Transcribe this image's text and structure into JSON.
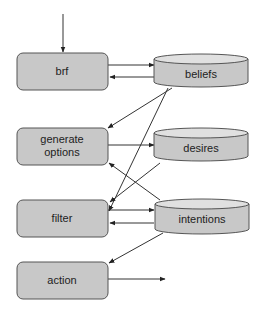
{
  "diagram": {
    "type": "BDI agent architecture flow",
    "processes": [
      {
        "id": "brf",
        "label": "brf"
      },
      {
        "id": "generate_options",
        "label_line1": "generate",
        "label_line2": "options"
      },
      {
        "id": "filter",
        "label": "filter"
      },
      {
        "id": "action",
        "label": "action"
      }
    ],
    "stores": [
      {
        "id": "beliefs",
        "label": "beliefs"
      },
      {
        "id": "desires",
        "label": "desires"
      },
      {
        "id": "intentions",
        "label": "intentions"
      }
    ],
    "edges": [
      {
        "from": "input",
        "to": "brf"
      },
      {
        "from": "brf",
        "to": "beliefs"
      },
      {
        "from": "beliefs",
        "to": "brf"
      },
      {
        "from": "beliefs",
        "to": "generate_options"
      },
      {
        "from": "beliefs",
        "to": "filter"
      },
      {
        "from": "generate_options",
        "to": "desires"
      },
      {
        "from": "desires",
        "to": "filter"
      },
      {
        "from": "intentions",
        "to": "generate_options"
      },
      {
        "from": "filter",
        "to": "intentions"
      },
      {
        "from": "intentions",
        "to": "filter"
      },
      {
        "from": "intentions",
        "to": "action"
      },
      {
        "from": "action",
        "to": "output"
      }
    ],
    "colors": {
      "box_fill": "#c8c8c8",
      "box_stroke": "#555555",
      "store_top": "#e0e0e0",
      "line": "#333333"
    }
  }
}
